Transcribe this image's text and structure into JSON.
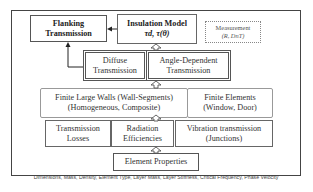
{
  "diagram": {
    "boxes": {
      "flanking": {
        "line1": "Flanking",
        "line2": "Transmission"
      },
      "insulation": {
        "line1": "Insulation Model",
        "line2": "τd, τ(θ)"
      },
      "measurement": {
        "line1": "Measurement",
        "line2": "(R, DnT)"
      },
      "diffuse": {
        "line1": "Diffuse",
        "line2": "Transmission"
      },
      "angle": {
        "line1": "Angle-Dependent",
        "line2": "Transmission"
      },
      "finite_walls": {
        "line1": "Finite Large Walls (Wall-Segments)",
        "line2": "(Homogeneous, Composite)"
      },
      "finite_elements": {
        "line1": "Finite Elements",
        "line2": "(Window, Door)"
      },
      "transmission_losses": {
        "line1": "Transmission",
        "line2": "Losses"
      },
      "radiation": {
        "line1": "Radiation",
        "line2": "Efficiencies"
      },
      "vibration": {
        "line1": "Vibration transmission",
        "line2": "(Junctions)"
      },
      "element_properties": {
        "line1": "Element Properties"
      }
    },
    "footer": "Dimensions, Mass, Density, Element Type, Layer Mass, Layer Stiffness, Critical Frequency, Phase Velocity"
  }
}
